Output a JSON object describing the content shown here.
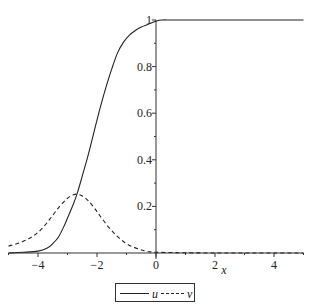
{
  "chart_data": {
    "type": "line",
    "title": "",
    "xlabel": "x",
    "ylabel": "",
    "xlim": [
      -5,
      5
    ],
    "ylim": [
      0,
      1
    ],
    "grid": false,
    "legend_position": "bottom",
    "x_ticks": [
      -4,
      -2,
      0,
      2,
      4
    ],
    "x_tick_labels": [
      "-4",
      "-2",
      "0",
      "2",
      "4"
    ],
    "y_ticks": [
      0.2,
      0.4,
      0.6,
      0.8,
      1
    ],
    "y_tick_labels": [
      "0.2",
      "0.4",
      "0.6",
      "0.8",
      "1"
    ],
    "series": [
      {
        "name": "u",
        "style": "solid",
        "color": "#222222",
        "x": [
          -5,
          -4.5,
          -4,
          -3.7,
          -3.5,
          -3.3,
          -3.1,
          -3.0,
          -2.8,
          -2.66,
          -2.5,
          -2.3,
          -2.1,
          -1.9,
          -1.7,
          -1.5,
          -1.3,
          -1.1,
          -0.9,
          -0.7,
          -0.5,
          -0.3,
          -0.1,
          0,
          0.2,
          0.5,
          1,
          2,
          3,
          4,
          5
        ],
        "values": [
          0.0,
          0.003,
          0.008,
          0.02,
          0.04,
          0.07,
          0.12,
          0.15,
          0.21,
          0.26,
          0.33,
          0.42,
          0.52,
          0.62,
          0.71,
          0.79,
          0.86,
          0.905,
          0.935,
          0.955,
          0.97,
          0.98,
          0.99,
          0.995,
          1.0,
          1.0,
          1.0,
          1.0,
          1.0,
          1.0,
          1.0
        ]
      },
      {
        "name": "v",
        "style": "dashed",
        "color": "#222222",
        "x": [
          -5,
          -4.6,
          -4.2,
          -3.9,
          -3.6,
          -3.3,
          -3.0,
          -2.8,
          -2.66,
          -2.5,
          -2.3,
          -2.1,
          -1.9,
          -1.6,
          -1.3,
          -1.0,
          -0.7,
          -0.4,
          -0.2,
          0,
          0.5,
          1,
          2,
          3,
          4,
          5
        ],
        "values": [
          0.03,
          0.045,
          0.07,
          0.1,
          0.145,
          0.195,
          0.235,
          0.25,
          0.252,
          0.245,
          0.225,
          0.195,
          0.16,
          0.11,
          0.07,
          0.04,
          0.022,
          0.01,
          0.005,
          0.003,
          0.002,
          0.001,
          0.0,
          0.0,
          0.0,
          0.0
        ]
      }
    ]
  },
  "legend": {
    "items": [
      {
        "label": "u",
        "style": "solid"
      },
      {
        "label": "v",
        "style": "dashed"
      }
    ]
  }
}
